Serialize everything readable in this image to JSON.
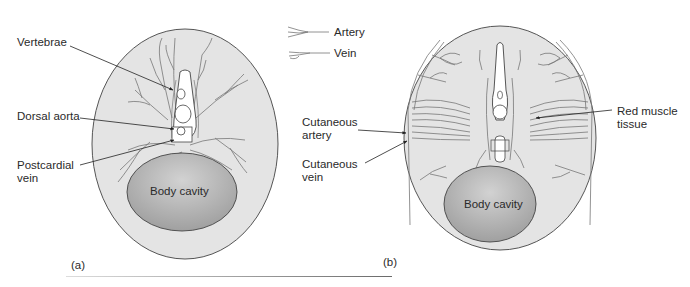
{
  "legend": {
    "items": [
      {
        "icon": "artery-line-icon",
        "label": "Artery"
      },
      {
        "icon": "vein-line-icon",
        "label": "Vein"
      }
    ]
  },
  "panel_a": {
    "label": "(a)",
    "labels": {
      "vertebrae": "Vertebrae",
      "dorsal_aorta": "Dorsal aorta",
      "postcardial_vein": "Postcardial\nvein",
      "body_cavity": "Body cavity"
    }
  },
  "panel_b": {
    "label": "(b)",
    "labels": {
      "cutaneous_artery": "Cutaneous\nartery",
      "cutaneous_vein": "Cutaneous\nvein",
      "red_muscle": "Red muscle\ntissue",
      "body_cavity": "Body cavity"
    }
  },
  "colors": {
    "body_fill": "#e4e4e4",
    "outline": "#555555",
    "cavity_dark": "#9a9a9a",
    "cavity_light": "#cfcfcf",
    "vessel": "#6a6a6a"
  }
}
